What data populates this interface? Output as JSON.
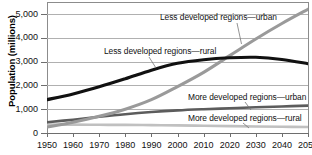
{
  "chart_data": {
    "type": "line",
    "title": "",
    "subtitle": "",
    "xlabel": "",
    "ylabel": "Population (millions)",
    "xlim": [
      1950,
      2050
    ],
    "ylim": [
      0,
      5500
    ],
    "grid": true,
    "legend_position": "inline-callouts",
    "x": [
      1950,
      1960,
      1970,
      1980,
      1990,
      2000,
      2010,
      2020,
      2030,
      2040,
      2050
    ],
    "xtick_labels": [
      "1950",
      "1960",
      "1970",
      "1980",
      "1990",
      "2000",
      "2010",
      "2020",
      "2030",
      "2040",
      "2050"
    ],
    "ytick_values": [
      0,
      1000,
      2000,
      3000,
      4000,
      5000
    ],
    "ytick_labels": [
      "0",
      "1,000",
      "2,000",
      "3,000",
      "4,000",
      "5,000"
    ],
    "series": [
      {
        "name": "Less developed regions—urban",
        "color": "#9a9a9a",
        "width": 3.1,
        "values": [
          250,
          450,
          700,
          1000,
          1400,
          1950,
          2550,
          3250,
          3950,
          4600,
          5200
        ]
      },
      {
        "name": "Less developed regions—rural",
        "color": "#111111",
        "width": 3.1,
        "values": [
          1400,
          1640,
          1940,
          2280,
          2640,
          2930,
          3080,
          3160,
          3180,
          3090,
          2910
        ]
      },
      {
        "name": "More developed regions—urban",
        "color": "#5c5c5c",
        "width": 2.6,
        "values": [
          450,
          560,
          680,
          790,
          880,
          950,
          1000,
          1040,
          1080,
          1115,
          1150
        ]
      },
      {
        "name": "More developed regions—rural",
        "color": "#c0c0c0",
        "width": 2.6,
        "values": [
          350,
          350,
          345,
          340,
          330,
          320,
          305,
          290,
          275,
          262,
          250
        ]
      }
    ],
    "annotations": [
      {
        "text": "Less developed regions—urban",
        "target_x": 2032,
        "target_y": 4100
      },
      {
        "text": "Less developed regions—rural",
        "target_x": 1990,
        "target_y": 2700
      },
      {
        "text": "More developed regions—urban",
        "target_x": 2035,
        "target_y": 1100
      },
      {
        "text": "More developed regions—rural",
        "target_x": 2032,
        "target_y": 270
      }
    ]
  },
  "axis": {
    "y_title": "Population (millions)"
  }
}
